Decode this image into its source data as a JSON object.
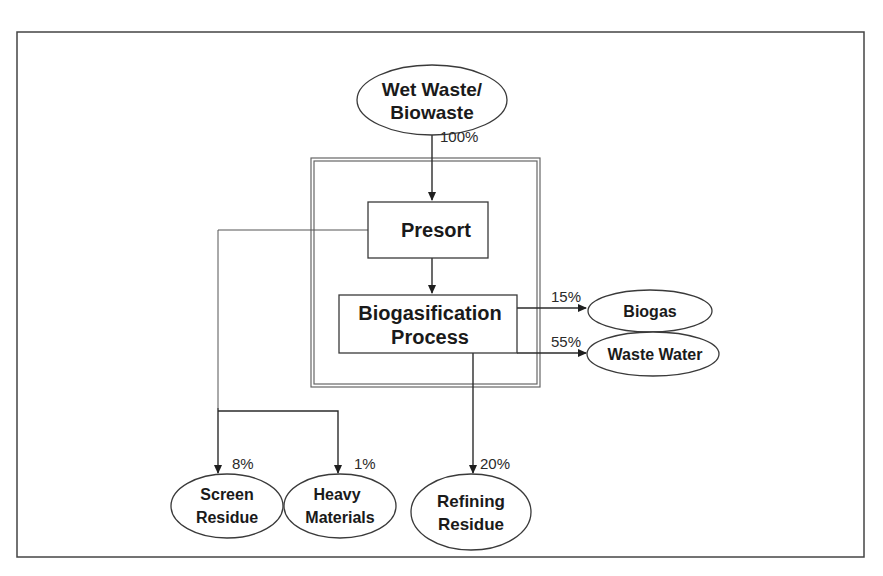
{
  "diagram": {
    "type": "flow",
    "nodes": {
      "input": {
        "label_lines": [
          "Wet Waste/",
          "Biowaste"
        ],
        "shape": "ellipse"
      },
      "presort": {
        "label_lines": [
          "Presort"
        ],
        "shape": "box"
      },
      "biogasification": {
        "label_lines": [
          "Biogasification",
          "Process"
        ],
        "shape": "box"
      },
      "biogas": {
        "label_lines": [
          "Biogas"
        ],
        "shape": "ellipse"
      },
      "waste_water": {
        "label_lines": [
          "Waste Water"
        ],
        "shape": "ellipse"
      },
      "screen_residue": {
        "label_lines": [
          "Screen",
          "Residue"
        ],
        "shape": "ellipse"
      },
      "heavy_materials": {
        "label_lines": [
          "Heavy",
          "Materials"
        ],
        "shape": "ellipse"
      },
      "refining_residue": {
        "label_lines": [
          "Refining",
          "Residue"
        ],
        "shape": "ellipse"
      }
    },
    "edges": [
      {
        "from": "input",
        "to": "presort",
        "label": "100%"
      },
      {
        "from": "presort",
        "to": "biogasification",
        "label": ""
      },
      {
        "from": "biogasification",
        "to": "biogas",
        "label": "15%"
      },
      {
        "from": "biogasification",
        "to": "waste_water",
        "label": "55%"
      },
      {
        "from": "presort",
        "to": "screen_residue",
        "label": "8%"
      },
      {
        "from": "presort",
        "to": "heavy_materials",
        "label": "1%"
      },
      {
        "from": "biogasification",
        "to": "refining_residue",
        "label": "20%"
      }
    ],
    "colors": {
      "stroke": "#2b2b2b",
      "text": "#1a1a1a",
      "background": "#ffffff"
    }
  }
}
